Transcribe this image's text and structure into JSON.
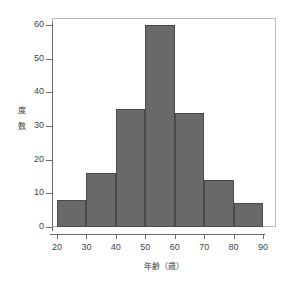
{
  "chart_data": {
    "type": "bar",
    "title": "",
    "subtitle": "",
    "xlabel": "年齢（歳）",
    "ylabel": "度数",
    "ylabel_chars": [
      "度",
      "数"
    ],
    "categories": [
      "20-30",
      "30-40",
      "40-50",
      "50-60",
      "60-70",
      "70-80",
      "80-90"
    ],
    "bin_edges": [
      20,
      30,
      40,
      50,
      60,
      70,
      80,
      90
    ],
    "values": [
      8,
      16,
      35,
      60,
      34,
      14,
      7
    ],
    "xlim": [
      20,
      90
    ],
    "ylim": [
      0,
      63
    ],
    "xticks": [
      20,
      30,
      40,
      50,
      60,
      70,
      80,
      90
    ],
    "yticks": [
      0,
      10,
      20,
      30,
      40,
      50,
      60
    ],
    "xtick_labels": [
      "20",
      "30",
      "40",
      "50",
      "60",
      "70",
      "80",
      "90"
    ],
    "ytick_labels": [
      "0",
      "10",
      "20",
      "30",
      "40",
      "50",
      "60"
    ],
    "grid": false,
    "legend": null,
    "legend_position": "none",
    "bar_fill_color": "#696969",
    "bar_edge_color": "#4a4a4a",
    "frame_color": "#b9b9b9",
    "axis_color": "#6b6b6b",
    "background_color": "#ffffff"
  }
}
